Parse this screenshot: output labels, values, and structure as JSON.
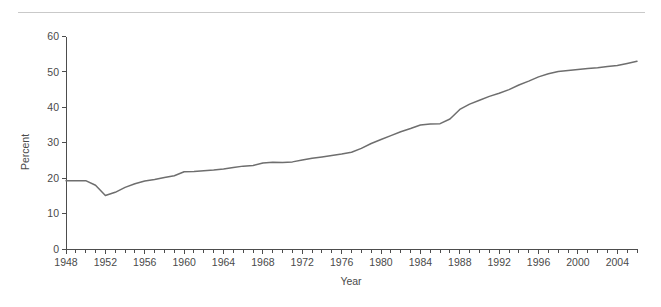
{
  "figure": {
    "background_color": "#ffffff",
    "rule_color": "#c9c9c9",
    "line_color": "#6e6e6e",
    "axis_color": "#4d4d4d",
    "text_color": "#4a4a4a"
  },
  "chart_data": {
    "type": "line",
    "title": "",
    "subtitle": "",
    "xlabel": "Year",
    "ylabel": "Percent",
    "xlim": [
      1948,
      2006
    ],
    "ylim": [
      0,
      60
    ],
    "grid": false,
    "legend": null,
    "x_tick_labels": [
      "1948",
      "1952",
      "1956",
      "1960",
      "1964",
      "1968",
      "1972",
      "1976",
      "1980",
      "1984",
      "1988",
      "1992",
      "1996",
      "2000",
      "2004"
    ],
    "x_tick_values": [
      1948,
      1952,
      1956,
      1960,
      1964,
      1968,
      1972,
      1976,
      1980,
      1984,
      1988,
      1992,
      1996,
      2000,
      2004
    ],
    "x_minor_tick_step": 1,
    "y_tick_labels": [
      "0",
      "10",
      "20",
      "30",
      "40",
      "50",
      "60"
    ],
    "y_tick_values": [
      0,
      10,
      20,
      30,
      40,
      50,
      60
    ],
    "x": [
      1948,
      1949,
      1950,
      1951,
      1952,
      1953,
      1954,
      1955,
      1956,
      1957,
      1958,
      1959,
      1960,
      1961,
      1962,
      1963,
      1964,
      1965,
      1966,
      1967,
      1968,
      1969,
      1970,
      1971,
      1972,
      1973,
      1974,
      1975,
      1976,
      1977,
      1978,
      1979,
      1980,
      1981,
      1982,
      1983,
      1984,
      1985,
      1986,
      1987,
      1988,
      1989,
      1990,
      1991,
      1992,
      1993,
      1994,
      1995,
      1996,
      1997,
      1998,
      1999,
      2000,
      2001,
      2002,
      2003,
      2004,
      2005,
      2006
    ],
    "values": [
      19.3,
      19.3,
      19.3,
      18.0,
      15.1,
      16.0,
      17.4,
      18.4,
      19.2,
      19.6,
      20.2,
      20.7,
      21.8,
      21.9,
      22.1,
      22.3,
      22.6,
      23.0,
      23.4,
      23.6,
      24.3,
      24.5,
      24.4,
      24.6,
      25.1,
      25.6,
      26.0,
      26.4,
      26.8,
      27.3,
      28.4,
      29.8,
      30.9,
      32.0,
      33.1,
      34.0,
      35.0,
      35.3,
      35.4,
      36.7,
      39.4,
      40.9,
      42.0,
      43.1,
      44.0,
      45.0,
      46.3,
      47.4,
      48.6,
      49.5,
      50.1,
      50.4,
      50.7,
      51.0,
      51.2,
      51.5,
      51.8,
      52.4,
      53.0
    ]
  }
}
